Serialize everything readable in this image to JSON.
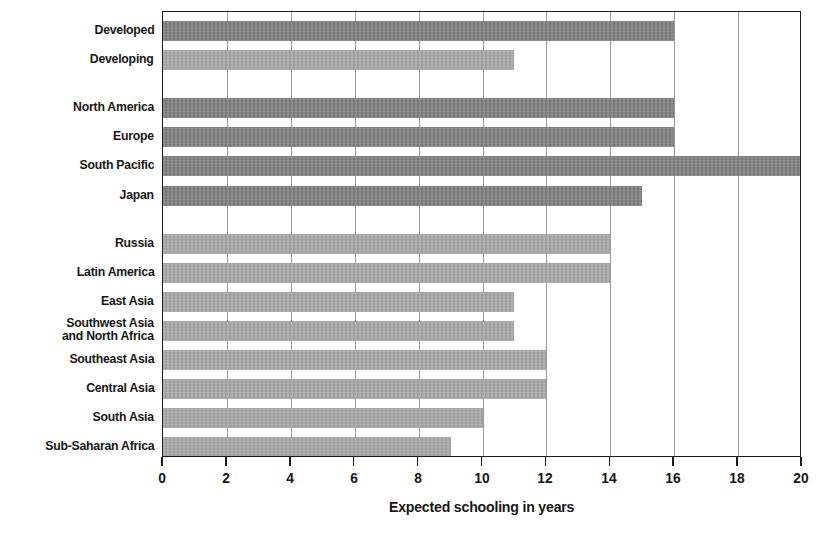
{
  "chart_data": {
    "type": "bar",
    "orientation": "horizontal",
    "title": "",
    "xlabel": "Expected schooling in years",
    "ylabel": "",
    "xlim": [
      0,
      20
    ],
    "xticks": [
      0,
      2,
      4,
      6,
      8,
      10,
      12,
      14,
      16,
      18,
      20
    ],
    "xtick_labels": [
      "0",
      "2",
      "4",
      "6",
      "8",
      "10",
      "12",
      "14",
      "16",
      "18",
      "20"
    ],
    "grid": "vertical",
    "legend": "none",
    "categories": [
      "Developed",
      "Developing",
      "North America",
      "Europe",
      "South Pacific",
      "Japan",
      "Russia",
      "Latin America",
      "East Asia",
      "Southwest Asia\nand North Africa",
      "Southeast Asia",
      "Central Asia",
      "South Asia",
      "Sub-Saharan Africa"
    ],
    "values": [
      16,
      11,
      16,
      16,
      20,
      15,
      14,
      14,
      11,
      11,
      12,
      12,
      10,
      9
    ],
    "bar_colors": [
      "dark",
      "light",
      "dark",
      "dark",
      "dark",
      "dark",
      "light",
      "light",
      "light",
      "light",
      "light",
      "light",
      "light",
      "light"
    ],
    "groups": [
      {
        "name": "summary",
        "categories": [
          "Developed",
          "Developing"
        ]
      },
      {
        "name": "developed-regions",
        "categories": [
          "North America",
          "Europe",
          "South Pacific",
          "Japan"
        ]
      },
      {
        "name": "developing-regions",
        "categories": [
          "Russia",
          "Latin America",
          "East Asia",
          "Southwest Asia and North Africa",
          "Southeast Asia",
          "Central Asia",
          "South Asia",
          "Sub-Saharan Africa"
        ]
      }
    ],
    "colors": {
      "dark_bar": "#7f7f7f",
      "light_bar": "#a8a8a8",
      "axis": "#1c1c1c",
      "gridline": "#9a9a9a",
      "text": "#161616",
      "background": "#ffffff"
    }
  }
}
